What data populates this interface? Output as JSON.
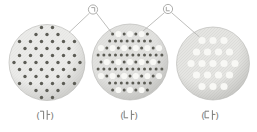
{
  "figure": {
    "background": "#ffffff",
    "callouts": [
      {
        "name": "callout-giyeok",
        "label": "㉠",
        "glyph": "giyeok",
        "cx": 93,
        "cy": 9.5,
        "r": 4.6,
        "leaders": [
          [
            89.6,
            13.0,
            69.0,
            32.5
          ],
          [
            96.4,
            13.0,
            111.8,
            33.0
          ]
        ]
      },
      {
        "name": "callout-nieun",
        "label": "㉡",
        "glyph": "nieun",
        "cx": 168,
        "cy": 9.0,
        "r": 4.6,
        "leaders": [
          [
            164.6,
            12.5,
            142.5,
            31.5
          ],
          [
            171.4,
            12.5,
            199.5,
            37.0
          ]
        ]
      }
    ],
    "vessels": [
      {
        "name": "vessel-ga",
        "label": "(가)",
        "glyph": "ga",
        "cx": 47,
        "cy": 62.5,
        "r": 38,
        "fill_light": "#ebebe9",
        "fill_dark": "#c8c8c5",
        "label_x": 45,
        "label_y": 115,
        "dots": {
          "pattern": "small-grid",
          "col": 11,
          "row": 7,
          "clip": 35.5,
          "small_r": 1.7
        }
      },
      {
        "name": "vessel-na",
        "label": "(나)",
        "glyph": "na",
        "cx": 130,
        "cy": 62,
        "r": 38,
        "fill_light": "#e1e1df",
        "fill_dark": "#bfbfbc",
        "label_x": 129,
        "label_y": 115,
        "dots": {
          "pattern": "mixed",
          "col": 5.8,
          "row": 7,
          "clip": 33,
          "small_r": 1.5,
          "large_r": 3.1
        }
      },
      {
        "name": "vessel-da",
        "label": "(다)",
        "glyph": "da",
        "cx": 213,
        "cy": 63.5,
        "r": 36.5,
        "fill_light": "#e5e5e2",
        "fill_dark": "#c2c2bf",
        "label_x": 210,
        "label_y": 115,
        "dots": {
          "pattern": "large-grid",
          "col": 11,
          "row": 11.5,
          "clip": 27.5,
          "large_r": 3.6
        }
      }
    ],
    "particles": {
      "small_dot_color": "#5c5c55",
      "large_dot_color": "#f8f8f5"
    },
    "colors": {
      "leader": "#b7b7b4",
      "label_text": "#7a7a78",
      "callout_stroke": "#9b9b98",
      "rim": "#b3b3b0",
      "texture": "#90908d"
    }
  }
}
